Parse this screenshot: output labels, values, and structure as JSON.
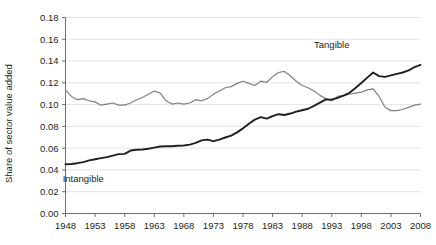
{
  "chart_data": {
    "type": "line",
    "title": "",
    "xlabel": "",
    "ylabel": "Share of sector value added",
    "xlim": [
      1948,
      2008
    ],
    "ylim": [
      0.0,
      0.18
    ],
    "ytick_step": 0.02,
    "xtick_step": 5,
    "grid": true,
    "legend": "inline-annotations",
    "yticks": [
      "0.00",
      "0.02",
      "0.04",
      "0.06",
      "0.08",
      "0.10",
      "0.12",
      "0.14",
      "0.16",
      "0.18"
    ],
    "ytick_values": [
      0.0,
      0.02,
      0.04,
      0.06,
      0.08,
      0.1,
      0.12,
      0.14,
      0.16,
      0.18
    ],
    "xticks": [
      "1948",
      "1953",
      "1958",
      "1963",
      "1968",
      "1973",
      "1978",
      "1983",
      "1988",
      "1993",
      "1998",
      "2003",
      "2008"
    ],
    "xtick_values": [
      1948,
      1953,
      1958,
      1963,
      1968,
      1973,
      1978,
      1983,
      1988,
      1993,
      1998,
      2003,
      2008
    ],
    "x": [
      1948,
      1949,
      1950,
      1951,
      1952,
      1953,
      1954,
      1955,
      1956,
      1957,
      1958,
      1959,
      1960,
      1961,
      1962,
      1963,
      1964,
      1965,
      1966,
      1967,
      1968,
      1969,
      1970,
      1971,
      1972,
      1973,
      1974,
      1975,
      1976,
      1977,
      1978,
      1979,
      1980,
      1981,
      1982,
      1983,
      1984,
      1985,
      1986,
      1987,
      1988,
      1989,
      1990,
      1991,
      1992,
      1993,
      1994,
      1995,
      1996,
      1997,
      1998,
      1999,
      2000,
      2001,
      2002,
      2003,
      2004,
      2005,
      2006,
      2007,
      2008
    ],
    "series": [
      {
        "name": "Tangible",
        "color": "#808080",
        "label_x": 1993,
        "label_y": 0.152,
        "values": [
          0.1135,
          0.1075,
          0.1045,
          0.1055,
          0.1035,
          0.1025,
          0.0995,
          0.1005,
          0.1015,
          0.0995,
          0.0995,
          0.1015,
          0.1045,
          0.1065,
          0.1095,
          0.1125,
          0.1105,
          0.1035,
          0.1005,
          0.1015,
          0.1005,
          0.1015,
          0.1045,
          0.1035,
          0.1055,
          0.1095,
          0.1125,
          0.1155,
          0.1165,
          0.1195,
          0.1215,
          0.1195,
          0.1175,
          0.1215,
          0.1205,
          0.1255,
          0.1295,
          0.1305,
          0.1265,
          0.1215,
          0.1175,
          0.1155,
          0.1125,
          0.1085,
          0.1055,
          0.1035,
          0.1075,
          0.1085,
          0.1095,
          0.1105,
          0.1115,
          0.1135,
          0.1145,
          0.1075,
          0.0975,
          0.0945,
          0.0945,
          0.0955,
          0.0975,
          0.0995,
          0.1005
        ]
      },
      {
        "name": "Intangible",
        "color": "#231f20",
        "label_x": 1951,
        "label_y": 0.029,
        "values": [
          0.0452,
          0.0455,
          0.0462,
          0.0472,
          0.0488,
          0.0498,
          0.0508,
          0.0518,
          0.0532,
          0.0545,
          0.0548,
          0.0578,
          0.0585,
          0.0588,
          0.0595,
          0.0605,
          0.0615,
          0.0618,
          0.0618,
          0.0622,
          0.0625,
          0.0632,
          0.0648,
          0.0672,
          0.0678,
          0.0665,
          0.0678,
          0.0698,
          0.0715,
          0.0745,
          0.0782,
          0.0825,
          0.0862,
          0.0885,
          0.0872,
          0.0895,
          0.0912,
          0.0905,
          0.0918,
          0.0935,
          0.0948,
          0.0962,
          0.0988,
          0.1018,
          0.1048,
          0.1045,
          0.1062,
          0.1082,
          0.1108,
          0.1152,
          0.1198,
          0.1248,
          0.1295,
          0.1262,
          0.1255,
          0.1268,
          0.1282,
          0.1295,
          0.1315,
          0.1345,
          0.1365
        ]
      }
    ]
  }
}
